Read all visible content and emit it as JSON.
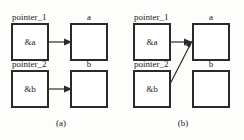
{
  "figure": {
    "background_color": "#fdfdfb",
    "stroke_color": "#2a2a2a",
    "text_color": "#1c1c1c"
  },
  "panels": [
    {
      "caption": "(a)",
      "pointer_top": {
        "name": "pointer_1",
        "value": "&a",
        "target_label": "a",
        "arrow": "horizontal"
      },
      "pointer_bottom": {
        "name": "pointer_2",
        "value": "&b",
        "target_label": "b",
        "arrow": "horizontal"
      }
    },
    {
      "caption": "(b)",
      "pointer_top": {
        "name": "pointer_1",
        "value": "&a",
        "target_label": "a",
        "arrow": "horizontal"
      },
      "pointer_bottom": {
        "name": "pointer_2",
        "value": "&b",
        "target_label": "b",
        "arrow": "diagonal-to-a"
      }
    }
  ]
}
